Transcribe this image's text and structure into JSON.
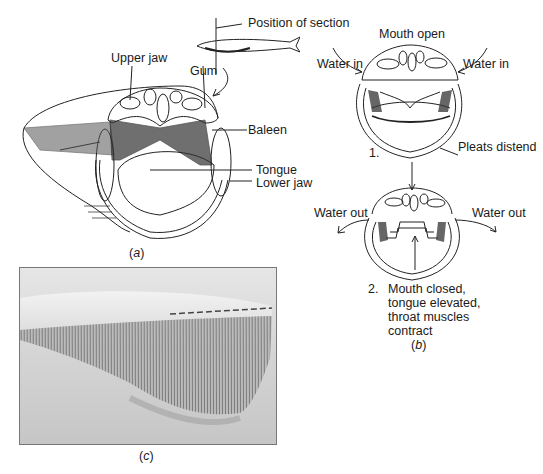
{
  "figure": {
    "panel_a": {
      "labels": {
        "position_of_section": "Position of section",
        "upper_jaw": "Upper jaw",
        "gum": "Gum",
        "baleen": "Baleen",
        "tongue": "Tongue",
        "lower_jaw": "Lower jaw"
      },
      "caption_open": "(",
      "caption_letter": "a",
      "caption_close": ")"
    },
    "panel_b": {
      "title": "Mouth open",
      "step1": {
        "number": "1.",
        "water_in_left": "Water in",
        "water_in_right": "Water in",
        "pleats": "Pleats distend"
      },
      "step2": {
        "number": "2.",
        "water_out_left": "Water out",
        "water_out_right": "Water out",
        "description_lines": [
          "Mouth closed,",
          "tongue elevated,",
          "throat muscles",
          "contract"
        ]
      },
      "caption_open": "(",
      "caption_letter": "b",
      "caption_close": ")"
    },
    "panel_c": {
      "photo_subject": "baleen plates photograph",
      "caption_open": "(",
      "caption_letter": "c",
      "caption_close": ")"
    }
  }
}
